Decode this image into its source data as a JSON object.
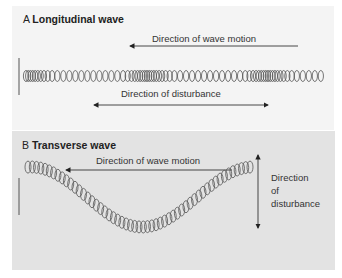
{
  "panel_a": {
    "letter": "A",
    "title": "Longitudinal wave",
    "wave_motion_label": "Direction of wave motion",
    "disturbance_label": "Direction of disturbance",
    "background": "#f4f4f4"
  },
  "panel_b": {
    "letter": "B",
    "title": "Transverse wave",
    "wave_motion_label": "Direction of wave motion",
    "disturbance_label_lines": [
      "Direction",
      "of",
      "disturbance"
    ],
    "background": "#e3e3e3"
  }
}
